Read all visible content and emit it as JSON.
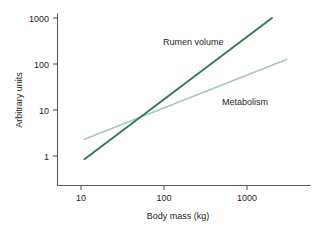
{
  "chart_data": {
    "type": "line",
    "title": "",
    "xlabel": "Body mass (kg)",
    "ylabel": "Arbitrary units",
    "xscale": "log",
    "yscale": "log",
    "xlim": [
      8,
      3500
    ],
    "ylim": [
      0.75,
      1400
    ],
    "xticks": [
      10,
      100,
      1000
    ],
    "xtick_labels": [
      "10",
      "100",
      "1000"
    ],
    "yticks": [
      1,
      10,
      100,
      1000
    ],
    "ytick_labels": [
      "1",
      "10",
      "100",
      "1000"
    ],
    "grid": false,
    "legend": "inline-annotations",
    "series": [
      {
        "name": "Rumen volume",
        "color": "#2e7d52",
        "x": [
          11,
          2000
        ],
        "y": [
          0.85,
          1000
        ],
        "annotation": "Rumen volume",
        "slope_note": "steeper than metabolism; crosses metabolism near 50 kg"
      },
      {
        "name": "Metabolism",
        "color": "#a9c6b8",
        "x": [
          11,
          3000
        ],
        "y": [
          2.3,
          125
        ],
        "annotation": "Metabolism",
        "slope_note": "shallower allometric slope"
      }
    ],
    "annotations": [
      {
        "text": "Rumen volume",
        "x_px": 163,
        "y_px": 42
      },
      {
        "text": "Metabolism",
        "x_px": 222,
        "y_px": 102
      }
    ]
  },
  "axes": {
    "x_title": "Body mass (kg)",
    "y_title": "Arbitrary units",
    "x_tick_0": "10",
    "x_tick_1": "100",
    "x_tick_2": "1000",
    "y_tick_0": "1000",
    "y_tick_1": "100",
    "y_tick_2": "10",
    "y_tick_3": "1"
  },
  "labels": {
    "rumen_volume": "Rumen volume",
    "metabolism": "Metabolism"
  },
  "colors": {
    "rumen_volume_line": "#2e7d52",
    "metabolism_line": "#a9c6b8",
    "axis": "#58595b",
    "text": "#231f20",
    "background": "#ffffff"
  }
}
